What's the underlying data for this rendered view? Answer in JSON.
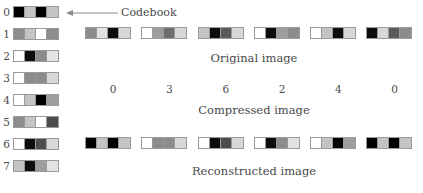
{
  "figure": {
    "title_visible": false,
    "callout": {
      "label": "Codebook",
      "icon": "left-arrow-icon"
    },
    "captions": {
      "original": "Original image",
      "compressed": "Compressed image",
      "reconstructed": "Reconstructed image"
    }
  },
  "palette": {
    "black": "#000000",
    "near_black": "#0d0d0d",
    "dark_gray": "#4d4d4d",
    "mid_gray": "#8c8c8c",
    "light_gray": "#c4c4c4",
    "very_light": "#e2e2e2",
    "white": "#ffffff",
    "border": "#9a9a9a",
    "text": "#4a4a4a"
  },
  "codebook": {
    "label": "Codebook",
    "entries": [
      {
        "index": "0",
        "cells": [
          "#000000",
          "#c4c4c4",
          "#000000",
          "#c4c4c4"
        ]
      },
      {
        "index": "1",
        "cells": [
          "#8c8c8c",
          "#c4c4c4",
          "#ffffff",
          "#8c8c8c"
        ]
      },
      {
        "index": "2",
        "cells": [
          "#ffffff",
          "#0d0d0d",
          "#8c8c8c",
          "#e2e2e2"
        ]
      },
      {
        "index": "3",
        "cells": [
          "#ffffff",
          "#8c8c8c",
          "#8c8c8c",
          "#d8d8d8"
        ]
      },
      {
        "index": "4",
        "cells": [
          "#ffffff",
          "#c4c4c4",
          "#000000",
          "#9e9e9e"
        ]
      },
      {
        "index": "5",
        "cells": [
          "#8c8c8c",
          "#c4c4c4",
          "#ffffff",
          "#4d4d4d"
        ]
      },
      {
        "index": "6",
        "cells": [
          "#ffffff",
          "#0d0d0d",
          "#4d4d4d",
          "#d8d8d8"
        ]
      },
      {
        "index": "7",
        "cells": [
          "#c4c4c4",
          "#0d0d0d",
          "#9e9e9e",
          "#e2e2e2"
        ]
      }
    ]
  },
  "original_image": {
    "caption": "Original image",
    "blocks": [
      {
        "cells": [
          "#8c8c8c",
          "#e2e2e2",
          "#0d0d0d",
          "#d8d8d8"
        ]
      },
      {
        "cells": [
          "#ffffff",
          "#9e9e9e",
          "#6e6e6e",
          "#d8d8d8"
        ]
      },
      {
        "cells": [
          "#c4c4c4",
          "#0d0d0d",
          "#5a5a5a",
          "#d8d8d8"
        ]
      },
      {
        "cells": [
          "#ffffff",
          "#0d0d0d",
          "#9e9e9e",
          "#8c8c8c"
        ]
      },
      {
        "cells": [
          "#ffffff",
          "#c4c4c4",
          "#0d0d0d",
          "#d8d8d8"
        ]
      },
      {
        "cells": [
          "#0d0d0d",
          "#d8d8d8",
          "#5a5a5a",
          "#8c8c8c"
        ]
      }
    ]
  },
  "compressed_image": {
    "caption": "Compressed image",
    "indices": [
      "0",
      "3",
      "6",
      "2",
      "4",
      "0"
    ]
  },
  "reconstructed_image": {
    "caption": "Reconstructed image",
    "blocks": [
      {
        "cells": [
          "#000000",
          "#c4c4c4",
          "#000000",
          "#c4c4c4"
        ]
      },
      {
        "cells": [
          "#ffffff",
          "#8c8c8c",
          "#8c8c8c",
          "#d8d8d8"
        ]
      },
      {
        "cells": [
          "#ffffff",
          "#0d0d0d",
          "#4d4d4d",
          "#d8d8d8"
        ]
      },
      {
        "cells": [
          "#ffffff",
          "#0d0d0d",
          "#8c8c8c",
          "#e2e2e2"
        ]
      },
      {
        "cells": [
          "#ffffff",
          "#c4c4c4",
          "#000000",
          "#9e9e9e"
        ]
      },
      {
        "cells": [
          "#000000",
          "#c4c4c4",
          "#000000",
          "#c4c4c4"
        ]
      }
    ]
  },
  "layout": {
    "codebook_row_tops": [
      6,
      28,
      50,
      72,
      94,
      116,
      138,
      160
    ],
    "original_row_top": 27,
    "original_caption_top": 51,
    "compressed_row_top": 82,
    "compressed_caption_top": 103,
    "reconstructed_row_top": 137,
    "reconstructed_caption_top": 164
  }
}
